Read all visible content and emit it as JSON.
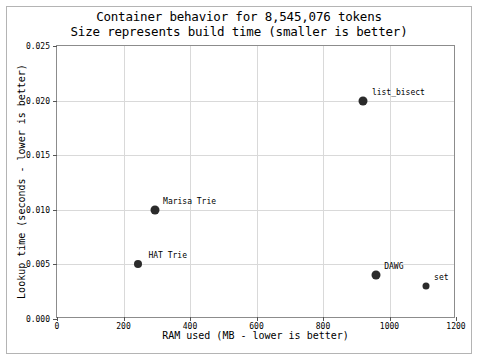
{
  "chart_data": {
    "type": "scatter",
    "title": "Container behavior for 8,545,076 tokens",
    "subtitle": "Size represents build time (smaller is better)",
    "xlabel": "RAM used (MB - lower is better)",
    "ylabel": "Lookup time (seconds - lower is better)",
    "xlim": [
      0,
      1200
    ],
    "ylim": [
      0.0,
      0.025
    ],
    "xticks": [
      "0",
      "200",
      "400",
      "600",
      "800",
      "1000",
      "1200"
    ],
    "xtick_values": [
      0,
      200,
      400,
      600,
      800,
      1000,
      1200
    ],
    "yticks": [
      "0.000",
      "0.005",
      "0.010",
      "0.015",
      "0.020",
      "0.025"
    ],
    "ytick_values": [
      0.0,
      0.005,
      0.01,
      0.015,
      0.02,
      0.025
    ],
    "grid": true,
    "legend": "none",
    "marker_color": "#2b2b2b",
    "size_encodes": "build time (smaller is better)",
    "points": [
      {
        "label": "HAT Trie",
        "x": 245,
        "y": 0.005,
        "size_px": 8,
        "label_dx": 10,
        "label_dy": -4
      },
      {
        "label": "Marisa Trie",
        "x": 295,
        "y": 0.01,
        "size_px": 9,
        "label_dx": 8,
        "label_dy": -4
      },
      {
        "label": "list_bisect",
        "x": 920,
        "y": 0.02,
        "size_px": 9,
        "label_dx": 9,
        "label_dy": -4
      },
      {
        "label": "DAWG",
        "x": 960,
        "y": 0.004,
        "size_px": 9,
        "label_dx": 8,
        "label_dy": -4
      },
      {
        "label": "set",
        "x": 1110,
        "y": 0.003,
        "size_px": 7,
        "label_dx": 8,
        "label_dy": -4
      }
    ]
  }
}
